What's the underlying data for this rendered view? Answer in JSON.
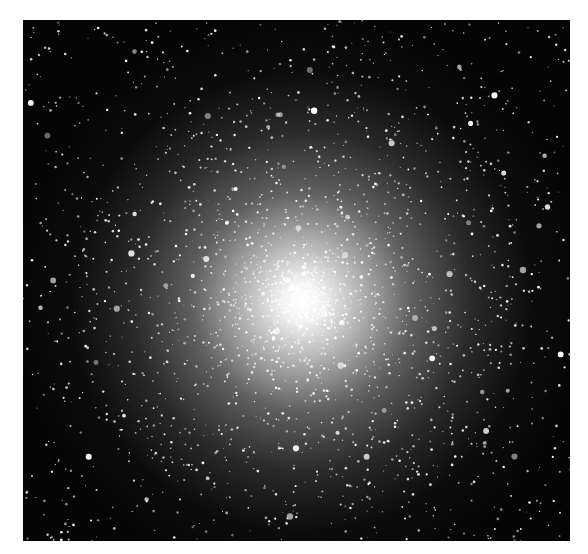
{
  "image": {
    "subject": "globular star cluster",
    "alt": "Dense globular star cluster with a bright white core against a black starfield",
    "colors": {
      "background": "#050505",
      "core": "#ffffff",
      "page": "#ffffff"
    },
    "core_position_pct": {
      "x": 51,
      "y": 54
    }
  }
}
